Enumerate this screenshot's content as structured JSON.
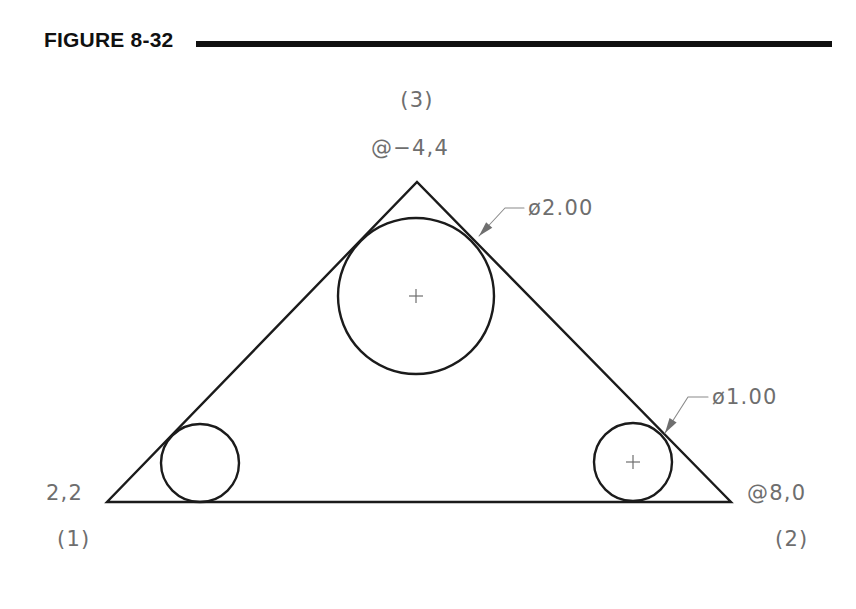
{
  "figure": {
    "title": "FIGURE 8-32",
    "rule_color": "#101010",
    "background_color": "#ffffff",
    "object_line_color": "#1b1b1b",
    "annotation_color": "#6e6e6e"
  },
  "chart_data": {
    "type": "diagram",
    "title": "FIGURE 8-32",
    "shapes": [
      {
        "name": "triangle",
        "type": "polygon",
        "vertices": [
          {
            "label": "(1)",
            "coordinate_text": "2,2",
            "x": 107,
            "y": 502
          },
          {
            "label": "(2)",
            "coordinate_text": "@8,0",
            "x": 731,
            "y": 502
          },
          {
            "label": "(3)",
            "coordinate_text": "@-4,4",
            "x": 417,
            "y": 182
          }
        ]
      },
      {
        "name": "large-circle",
        "type": "circle",
        "cx": 416,
        "cy": 296,
        "r": 78,
        "diameter_label": "ø2.00",
        "has_center_mark": true
      },
      {
        "name": "left-small-circle",
        "type": "circle",
        "cx": 200,
        "cy": 463,
        "r": 39,
        "diameter_label": "",
        "has_center_mark": false
      },
      {
        "name": "right-small-circle",
        "type": "circle",
        "cx": 633,
        "cy": 462,
        "r": 39,
        "diameter_label": "ø1.00",
        "has_center_mark": true
      }
    ],
    "labels": [
      {
        "name": "vertex-3-number",
        "text": "(3)",
        "x": 417,
        "y": 107,
        "anchor": "middle"
      },
      {
        "name": "vertex-3-coordinate",
        "text": "@−4,4",
        "x": 410,
        "y": 155,
        "anchor": "middle"
      },
      {
        "name": "vertex-1-coordinate",
        "text": "2,2",
        "x": 46,
        "y": 500,
        "anchor": "start"
      },
      {
        "name": "vertex-1-number",
        "text": "(1)",
        "x": 57,
        "y": 546,
        "anchor": "start"
      },
      {
        "name": "vertex-2-coordinate",
        "text": "@8,0",
        "x": 747,
        "y": 500,
        "anchor": "start"
      },
      {
        "name": "vertex-2-number",
        "text": "(2)",
        "x": 775,
        "y": 546,
        "anchor": "start"
      },
      {
        "name": "large-circle-diameter",
        "text": "ø2.00",
        "x": 528,
        "y": 215,
        "anchor": "start"
      },
      {
        "name": "right-circle-diameter",
        "text": "ø1.00",
        "x": 712,
        "y": 404,
        "anchor": "start"
      }
    ],
    "leaders": [
      {
        "name": "large-circle-leader",
        "target_label": "ø2.00",
        "tip": {
          "x": 479,
          "y": 236
        },
        "elbow": {
          "x": 505,
          "y": 208
        },
        "shoulder": {
          "x": 524,
          "y": 208
        }
      },
      {
        "name": "right-circle-leader",
        "target_label": "ø1.00",
        "tip": {
          "x": 665,
          "y": 433
        },
        "elbow": {
          "x": 688,
          "y": 397
        },
        "shoulder": {
          "x": 708,
          "y": 397
        }
      }
    ]
  }
}
